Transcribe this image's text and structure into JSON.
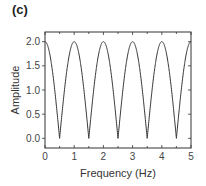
{
  "panel_label": "(c)",
  "chart_data": {
    "type": "line",
    "title": "",
    "xlabel": "Frequency (Hz)",
    "ylabel": "Amplitude",
    "xlim": [
      0,
      5
    ],
    "ylim": [
      -0.2,
      2.2
    ],
    "xticks": [
      "0",
      "1",
      "2",
      "3",
      "4",
      "5"
    ],
    "yticks": [
      "0.0",
      "0.5",
      "1.0",
      "1.5",
      "2.0"
    ],
    "grid": false,
    "legend": null,
    "series": [
      {
        "name": "|2cos(pi f)|",
        "description": "Comb-filter amplitude response: peaks of 2.0 at integer Hz, zeros at half-integer Hz",
        "x": [
          0,
          0.25,
          0.5,
          0.75,
          1,
          1.25,
          1.5,
          1.75,
          2,
          2.25,
          2.5,
          2.75,
          3,
          3.25,
          3.5,
          3.75,
          4,
          4.25,
          4.5,
          4.75,
          5
        ],
        "values": [
          2.0,
          1.41,
          0.0,
          1.41,
          2.0,
          1.41,
          0.0,
          1.41,
          2.0,
          1.41,
          0.0,
          1.41,
          2.0,
          1.41,
          0.0,
          1.41,
          2.0,
          1.41,
          0.0,
          1.41,
          2.0
        ]
      }
    ]
  }
}
